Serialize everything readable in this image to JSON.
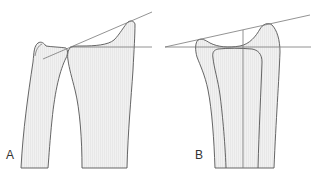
{
  "figure": {
    "panels": [
      {
        "id": "A",
        "label": "A",
        "description": "Lateral view of distal radius and ulna with articular tilt reference lines"
      },
      {
        "id": "B",
        "label": "B",
        "description": "Posteroanterior view of distal radius with radial inclination reference lines"
      }
    ],
    "colors": {
      "outline": "#555555",
      "fill": "#ececec",
      "reference_line": "#777777",
      "label": "#333333"
    }
  }
}
